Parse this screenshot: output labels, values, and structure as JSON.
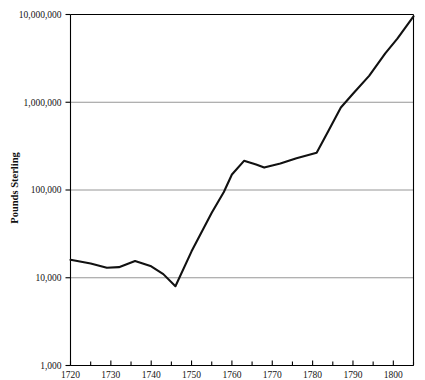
{
  "chart_data": {
    "type": "line",
    "title": "",
    "xlabel": "",
    "ylabel": "Pounds Sterling",
    "yscale": "log",
    "ylim": [
      1000,
      10000000
    ],
    "xlim": [
      1720,
      1805
    ],
    "grid": true,
    "legend": false,
    "y_ticks": [
      1000,
      10000,
      100000,
      1000000,
      10000000
    ],
    "y_tick_labels": [
      "1,000",
      "10,000",
      "100,000",
      "1,000,000",
      "10,000,000"
    ],
    "x_ticks": [
      1720,
      1730,
      1740,
      1750,
      1760,
      1770,
      1780,
      1790,
      1800
    ],
    "x_tick_labels": [
      "1720",
      "1730",
      "1740",
      "1750",
      "1760",
      "1770",
      "1780",
      "1790",
      "1800"
    ],
    "x_minor_ticks": [
      1725,
      1735,
      1745,
      1755,
      1765,
      1775,
      1785,
      1795,
      1805
    ],
    "series": [
      {
        "name": "Pounds Sterling",
        "color": "#111111",
        "x": [
          1720,
          1725,
          1729,
          1732,
          1736,
          1740,
          1743,
          1746,
          1750,
          1755,
          1758,
          1760,
          1763,
          1766,
          1768,
          1772,
          1776,
          1781,
          1784,
          1787,
          1790,
          1794,
          1798,
          1801,
          1805
        ],
        "values": [
          16000,
          14500,
          13000,
          13200,
          15500,
          13500,
          11000,
          8000,
          20000,
          55000,
          95000,
          150000,
          215000,
          195000,
          180000,
          200000,
          230000,
          265000,
          480000,
          870000,
          1250000,
          2000000,
          3600000,
          5300000,
          9500000
        ]
      }
    ]
  },
  "axis_titles": {
    "y": "Pounds Sterling"
  }
}
